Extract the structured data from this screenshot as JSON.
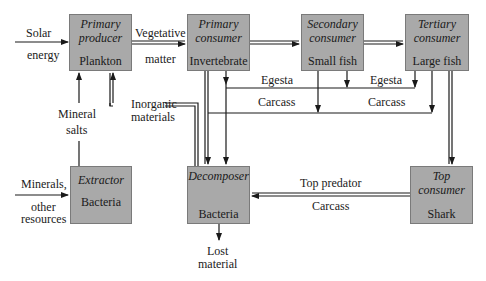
{
  "boxes": {
    "primary_producer": {
      "role": "Primary\nproducer",
      "role_l1": "Primary",
      "role_l2": "producer",
      "organism": "Plankton"
    },
    "primary_consumer": {
      "role_l1": "Primary",
      "role_l2": "consumer",
      "organism": "Invertebrate"
    },
    "secondary_consumer": {
      "role_l1": "Secondary",
      "role_l2": "consumer",
      "organism": "Small fish"
    },
    "tertiary_consumer": {
      "role_l1": "Tertiary",
      "role_l2": "consumer",
      "organism": "Large fish"
    },
    "extractor": {
      "role_l1": "Extractor",
      "organism": "Bacteria"
    },
    "decomposer": {
      "role_l1": "Decomposer",
      "organism": "Bacteria"
    },
    "top_consumer": {
      "role_l1": "Top",
      "role_l2": "consumer",
      "organism": "Shark"
    }
  },
  "labels": {
    "solar": "Solar",
    "energy": "energy",
    "vegetative": "Vegetative",
    "matter": "matter",
    "egesta_1": "Egesta",
    "egesta_2": "Egesta",
    "carcass_1": "Carcass",
    "carcass_2": "Carcass",
    "mineral": "Mineral",
    "salts": "salts",
    "inorganic": "Inorganic",
    "materials": "materials",
    "minerals": "Minerals,",
    "other": "other",
    "resources": "resources",
    "top_predator": "Top predator",
    "carcass_3": "Carcass",
    "lost": "Lost",
    "material": "material"
  },
  "colors": {
    "box_fill": "#a9a9a9",
    "line": "#1a1a1a"
  }
}
